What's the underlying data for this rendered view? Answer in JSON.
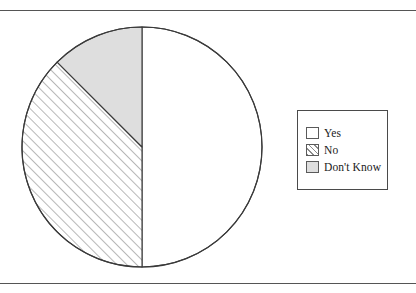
{
  "figure": {
    "width": 416,
    "height": 293,
    "background": "#ffffff",
    "rule_color": "#555555",
    "has_top_rule": true,
    "has_bottom_rule": true
  },
  "pie": {
    "center_x": 142,
    "center_y": 147,
    "radius": 120,
    "outline_color": "#3a3a3a",
    "outline_width": 1.2,
    "start_angle_deg": 0,
    "direction": "clockwise"
  },
  "legend": {
    "box": {
      "x": 297,
      "y": 110,
      "width": 91,
      "height": 80
    },
    "border_color": "#4a4a4a",
    "items": [
      {
        "label": "Yes",
        "swatch": "solid-white",
        "color": "#ffffff"
      },
      {
        "label": "No",
        "swatch": "hatched",
        "color": "#8a8a8a"
      },
      {
        "label": "Don't Know",
        "swatch": "solid-grey",
        "color": "#dedede"
      }
    ]
  },
  "chart_data": {
    "type": "pie",
    "title": "",
    "labels": [
      "Yes",
      "No",
      "Don't Know"
    ],
    "values": [
      50,
      37.5,
      12.5
    ],
    "units": "percent",
    "total": 100,
    "start_angle_deg": 0,
    "direction": "clockwise",
    "legend_position": "right",
    "slice_styles": [
      "solid-white",
      "diagonal-hatch",
      "solid-grey"
    ],
    "slice_colors": [
      "#ffffff",
      "#ffffff",
      "#dedede"
    ],
    "slice_edge_color": "#3a3a3a",
    "slice_angles_deg": [
      {
        "label": "Yes",
        "start": 0,
        "end": 180
      },
      {
        "label": "No",
        "start": 180,
        "end": 315
      },
      {
        "label": "Don't Know",
        "start": 315,
        "end": 360
      }
    ],
    "data_labels_shown": false,
    "grid": false
  }
}
